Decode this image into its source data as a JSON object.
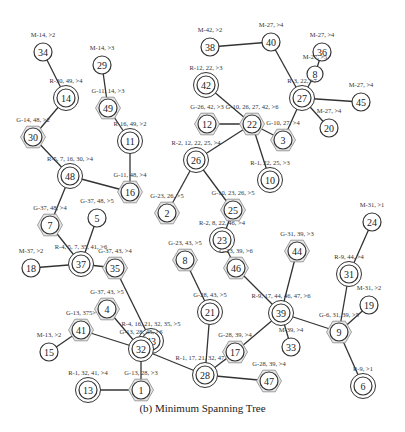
{
  "caption": "(b) Minimum Spanning Tree",
  "colors": {
    "stroke": "#333333",
    "text": "#222222",
    "hex_fill": "#e6e6e6",
    "background": "#ffffff"
  },
  "legend_note": "M = circle, R = double circle, G = hexagon",
  "nodes": [
    {
      "id": "34",
      "x": 43,
      "y": 52,
      "type": "M",
      "label": "M-14, >2"
    },
    {
      "id": "14",
      "x": 66,
      "y": 98,
      "type": "R",
      "label": "R-30, 49, >4"
    },
    {
      "id": "30",
      "x": 33,
      "y": 137,
      "type": "G",
      "label": "G-14, 48, >2"
    },
    {
      "id": "29",
      "x": 102,
      "y": 65,
      "type": "M",
      "label": "M-14, >3"
    },
    {
      "id": "49",
      "x": 108,
      "y": 108,
      "type": "G",
      "label": "G-11, 14, >3"
    },
    {
      "id": "11",
      "x": 130,
      "y": 141,
      "type": "R",
      "label": "R-16, 49, >2"
    },
    {
      "id": "48",
      "x": 70,
      "y": 176,
      "type": "R",
      "label": "R-5, 7, 16, 30, >4"
    },
    {
      "id": "16",
      "x": 130,
      "y": 192,
      "type": "G",
      "label": "G-11, 48, >4"
    },
    {
      "id": "7",
      "x": 50,
      "y": 225,
      "type": "G",
      "label": "G-37, 48, >4"
    },
    {
      "id": "5",
      "x": 97,
      "y": 218,
      "type": "M",
      "label": "G-37, 48, >5"
    },
    {
      "id": "18",
      "x": 31,
      "y": 268,
      "type": "M",
      "label": "M-37, >2"
    },
    {
      "id": "37",
      "x": 81,
      "y": 264,
      "type": "R",
      "label": "R-4, 5, 7, 35, 41, >6"
    },
    {
      "id": "35",
      "x": 115,
      "y": 268,
      "type": "G",
      "label": "G-37, 43, >4"
    },
    {
      "id": "4",
      "x": 107,
      "y": 309,
      "type": "G",
      "label": "G-37, 43, >5"
    },
    {
      "id": "41",
      "x": 81,
      "y": 330,
      "type": "G",
      "label": "G-13, 375>"
    },
    {
      "id": "15",
      "x": 49,
      "y": 352,
      "type": "M",
      "label": "M-13, >2"
    },
    {
      "id": "43",
      "x": 151,
      "y": 341,
      "type": "R",
      "label": "R-4, 16, 21, 32, 35, >5"
    },
    {
      "id": "32",
      "x": 141,
      "y": 349,
      "type": "R",
      "label": "G-13, 28, 45, >6"
    },
    {
      "id": "13",
      "x": 88,
      "y": 390,
      "type": "R",
      "label": "R-1, 32, 41, >4"
    },
    {
      "id": "1",
      "x": 141,
      "y": 390,
      "type": "G",
      "label": "G-13, 28, >3"
    },
    {
      "id": "8",
      "x": 185,
      "y": 260,
      "type": "G",
      "label": "G-23, 43, >5"
    },
    {
      "id": "21",
      "x": 210,
      "y": 312,
      "type": "R",
      "label": "G-28, 43, >5"
    },
    {
      "id": "28",
      "x": 205,
      "y": 375,
      "type": "R",
      "label": "R-1, 17, 21, 32, 47, >5"
    },
    {
      "id": "17",
      "x": 235,
      "y": 352,
      "type": "G",
      "label": "G-28, 39, >4"
    },
    {
      "id": "47",
      "x": 269,
      "y": 381,
      "type": "G",
      "label": "G-28, 39, >4"
    },
    {
      "id": "38",
      "x": 210,
      "y": 47,
      "type": "M",
      "label": "M-42, >2"
    },
    {
      "id": "40",
      "x": 271,
      "y": 42,
      "type": "M",
      "label": "M-27, >4"
    },
    {
      "id": "36",
      "x": 322,
      "y": 52,
      "type": "M",
      "label": "M-27, >4"
    },
    {
      "id": "8b",
      "x": 315,
      "y": 74,
      "type": "M",
      "label": "M-27, >5",
      "display": "8"
    },
    {
      "id": "27",
      "x": 302,
      "y": 98,
      "type": "R",
      "label": "R-3, 22, >7"
    },
    {
      "id": "45",
      "x": 361,
      "y": 102,
      "type": "M",
      "label": "M-27, >4"
    },
    {
      "id": "20",
      "x": 329,
      "y": 128,
      "type": "M",
      "label": "M-27, >4"
    },
    {
      "id": "42",
      "x": 206,
      "y": 85,
      "type": "R",
      "label": "R-12, 22, >3"
    },
    {
      "id": "12",
      "x": 207,
      "y": 124,
      "type": "G",
      "label": "G-26, 42, >3"
    },
    {
      "id": "22",
      "x": 252,
      "y": 124,
      "type": "G",
      "label": "G-10, 26, 27, 42, >6"
    },
    {
      "id": "3",
      "x": 283,
      "y": 140,
      "type": "G",
      "label": "G-10, 27, >4"
    },
    {
      "id": "26",
      "x": 196,
      "y": 160,
      "type": "R",
      "label": "R-2, 12, 22, 25, >4"
    },
    {
      "id": "10",
      "x": 270,
      "y": 180,
      "type": "R",
      "label": "R-1, 22, 25, >3"
    },
    {
      "id": "2",
      "x": 167,
      "y": 213,
      "type": "G",
      "label": "G-23, 26, >5"
    },
    {
      "id": "25",
      "x": 233,
      "y": 210,
      "type": "G",
      "label": "G-10, 23, 26, >5"
    },
    {
      "id": "23",
      "x": 222,
      "y": 240,
      "type": "R",
      "label": "R-2, 8, 22, 46, >4"
    },
    {
      "id": "46",
      "x": 236,
      "y": 268,
      "type": "G",
      "label": "G-23, 39, >6"
    },
    {
      "id": "44",
      "x": 297,
      "y": 251,
      "type": "G",
      "label": "G-31, 39, >3"
    },
    {
      "id": "39",
      "x": 281,
      "y": 313,
      "type": "R",
      "label": "R-9, 17, 44, 46, 47, >6"
    },
    {
      "id": "33",
      "x": 291,
      "y": 347,
      "type": "M",
      "label": "M-39, >4"
    },
    {
      "id": "24",
      "x": 372,
      "y": 222,
      "type": "M",
      "label": "M-31, >1"
    },
    {
      "id": "31",
      "x": 349,
      "y": 274,
      "type": "R",
      "label": "R-9, 44, >4"
    },
    {
      "id": "19",
      "x": 369,
      "y": 305,
      "type": "M",
      "label": "M-31, >2"
    },
    {
      "id": "9",
      "x": 339,
      "y": 332,
      "type": "G",
      "label": "G-6, 31, 39, >5"
    },
    {
      "id": "6",
      "x": 363,
      "y": 386,
      "type": "R",
      "label": "R-9, >1"
    }
  ],
  "edges": [
    [
      "34",
      "14"
    ],
    [
      "14",
      "30"
    ],
    [
      "30",
      "48"
    ],
    [
      "29",
      "49"
    ],
    [
      "49",
      "11"
    ],
    [
      "11",
      "16"
    ],
    [
      "48",
      "16"
    ],
    [
      "48",
      "7"
    ],
    [
      "7",
      "37"
    ],
    [
      "5",
      "37"
    ],
    [
      "18",
      "37"
    ],
    [
      "37",
      "35"
    ],
    [
      "35",
      "43"
    ],
    [
      "4",
      "32"
    ],
    [
      "43",
      "32"
    ],
    [
      "41",
      "32"
    ],
    [
      "41",
      "15"
    ],
    [
      "32",
      "28"
    ],
    [
      "32",
      "1"
    ],
    [
      "13",
      "1"
    ],
    [
      "8",
      "21"
    ],
    [
      "21",
      "28"
    ],
    [
      "28",
      "17"
    ],
    [
      "28",
      "47"
    ],
    [
      "17",
      "39"
    ],
    [
      "46",
      "39"
    ],
    [
      "44",
      "39"
    ],
    [
      "39",
      "33"
    ],
    [
      "39",
      "9"
    ],
    [
      "31",
      "9"
    ],
    [
      "24",
      "31"
    ],
    [
      "19",
      "9"
    ],
    [
      "9",
      "6"
    ],
    [
      "38",
      "40"
    ],
    [
      "40",
      "27"
    ],
    [
      "36",
      "8b"
    ],
    [
      "8b",
      "27"
    ],
    [
      "27",
      "45"
    ],
    [
      "27",
      "20"
    ],
    [
      "27",
      "3"
    ],
    [
      "42",
      "22"
    ],
    [
      "12",
      "22"
    ],
    [
      "22",
      "3"
    ],
    [
      "22",
      "26"
    ],
    [
      "22",
      "10"
    ],
    [
      "26",
      "2"
    ],
    [
      "26",
      "25"
    ],
    [
      "25",
      "23"
    ],
    [
      "23",
      "46"
    ]
  ]
}
